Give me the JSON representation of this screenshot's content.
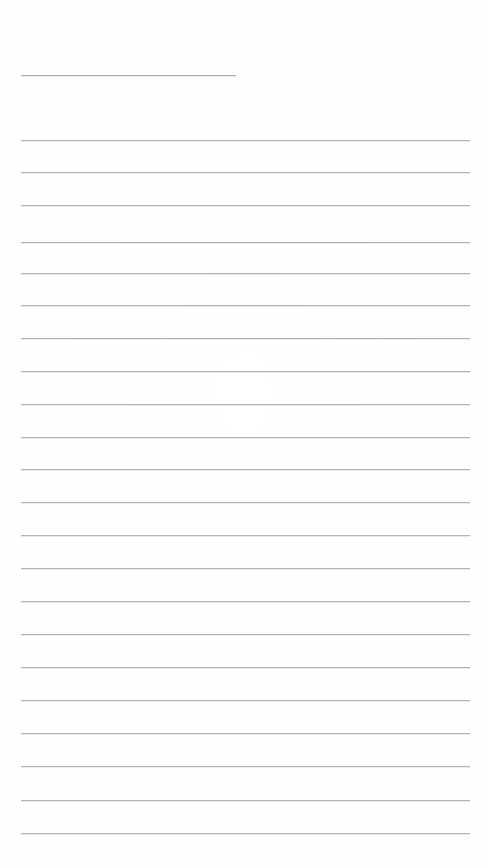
{
  "document": {
    "kind": "lined-paper",
    "title_text": "",
    "page_background_color": "#fefefe",
    "rule_color": "#b4b4b4",
    "rule_thickness_px": 1,
    "content_is_blank": true,
    "page_width_px": 488,
    "page_height_px": 866,
    "left_margin_px": 21,
    "right_edge_px": 470,
    "line_spacing_px": 32.3
  },
  "header_rule": {
    "label": "header-rule",
    "x_start_px": 21,
    "x_end_px": 236,
    "y_px": 75,
    "color": "#aeaeae",
    "text": ""
  },
  "rules": [
    {
      "index": 1,
      "y_px": 140,
      "text": ""
    },
    {
      "index": 2,
      "y_px": 172,
      "text": ""
    },
    {
      "index": 3,
      "y_px": 205,
      "text": ""
    },
    {
      "index": 4,
      "y_px": 242,
      "text": ""
    },
    {
      "index": 5,
      "y_px": 273,
      "text": ""
    },
    {
      "index": 6,
      "y_px": 305,
      "text": ""
    },
    {
      "index": 7,
      "y_px": 338,
      "text": ""
    },
    {
      "index": 8,
      "y_px": 371,
      "text": ""
    },
    {
      "index": 9,
      "y_px": 404,
      "text": ""
    },
    {
      "index": 10,
      "y_px": 437,
      "text": ""
    },
    {
      "index": 11,
      "y_px": 469,
      "text": ""
    },
    {
      "index": 12,
      "y_px": 502,
      "text": ""
    },
    {
      "index": 13,
      "y_px": 535,
      "text": ""
    },
    {
      "index": 14,
      "y_px": 568,
      "text": ""
    },
    {
      "index": 15,
      "y_px": 601,
      "text": ""
    },
    {
      "index": 16,
      "y_px": 634,
      "text": ""
    },
    {
      "index": 17,
      "y_px": 667,
      "text": ""
    },
    {
      "index": 18,
      "y_px": 700,
      "text": ""
    },
    {
      "index": 19,
      "y_px": 733,
      "text": ""
    },
    {
      "index": 20,
      "y_px": 766,
      "text": ""
    },
    {
      "index": 21,
      "y_px": 800,
      "text": ""
    },
    {
      "index": 22,
      "y_px": 833,
      "text": ""
    }
  ]
}
